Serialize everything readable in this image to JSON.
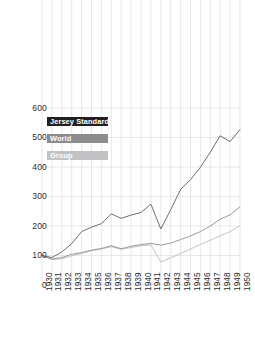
{
  "chart_data": {
    "type": "line",
    "title": "",
    "subtitle": "",
    "xlabel": "",
    "ylabel": "",
    "x": [
      1930,
      1931,
      1932,
      1933,
      1934,
      1935,
      1936,
      1937,
      1938,
      1939,
      1940,
      1941,
      1942,
      1943,
      1944,
      1945,
      1946,
      1947,
      1948,
      1949,
      1950
    ],
    "xlim": [
      1930,
      1950
    ],
    "ylim": [
      0,
      630
    ],
    "yticks": [
      0,
      100,
      200,
      300,
      400,
      500,
      600
    ],
    "ytick_labels": [
      "0",
      "100",
      "200",
      "300",
      "400",
      "500",
      "600"
    ],
    "xtick_labels": [
      "1930",
      "1931",
      "1932",
      "1933",
      "1934",
      "1935",
      "1936",
      "1937",
      "1938",
      "1939",
      "1940",
      "1941",
      "1942",
      "1943",
      "1944",
      "1945",
      "1946",
      "1947",
      "1948",
      "1949",
      "1950"
    ],
    "grid": true,
    "grid_color": "#d9d9db",
    "legend_position": "upper-left",
    "series": [
      {
        "name": "Jersey Standard",
        "color": "#6e6e70",
        "swatch_color": "#231f20",
        "values": [
          100,
          93,
          112,
          140,
          181,
          196,
          208,
          241,
          226,
          237,
          246,
          274,
          190,
          255,
          324,
          357,
          399,
          450,
          506,
          486,
          527
        ]
      },
      {
        "name": "World",
        "color": "#9a9a9c",
        "swatch_color": "#8c8c8e",
        "values": [
          100,
          88,
          93,
          104,
          110,
          118,
          124,
          133,
          123,
          131,
          137,
          141,
          135,
          142,
          154,
          166,
          181,
          200,
          223,
          238,
          265
        ]
      },
      {
        "name": "Group",
        "color": "#c2c2c4",
        "swatch_color": "#c2c2c4",
        "values": [
          100,
          86,
          89,
          99,
          107,
          116,
          122,
          130,
          121,
          127,
          133,
          136,
          78,
          92,
          107,
          122,
          137,
          152,
          167,
          181,
          201
        ]
      }
    ]
  },
  "legend": {
    "items": [
      {
        "label": "Jersey Standard"
      },
      {
        "label": "World"
      },
      {
        "label": "Group"
      }
    ]
  },
  "colors": {
    "background": "#ffffff",
    "grid": "#d9d9db",
    "text": "#2b2b2b",
    "series_jersey": "#6e6e70",
    "series_world": "#9a9a9c",
    "series_group": "#c2c2c4",
    "swatch_jersey": "#231f20",
    "swatch_world": "#8c8c8e",
    "swatch_group": "#c2c2c4"
  }
}
